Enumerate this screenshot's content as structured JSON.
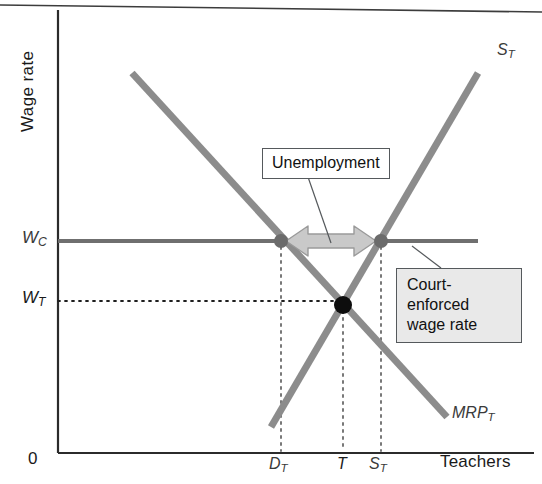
{
  "figure": {
    "type": "economics-labor-market-diagram",
    "background": "#ffffff"
  },
  "axes": {
    "y_label": "Wage rate",
    "x_label": "Teachers",
    "origin_label": "0",
    "axis_color": "#2b2b2b"
  },
  "y_ticks": [
    {
      "id": "wc",
      "base": "W",
      "sub": "C",
      "y": 241
    },
    {
      "id": "wt",
      "base": "W",
      "sub": "T",
      "y": 301
    }
  ],
  "x_ticks": [
    {
      "id": "dt",
      "base": "D",
      "sub": "T",
      "x": 281
    },
    {
      "id": "t",
      "base": "T",
      "sub": "",
      "x": 343
    },
    {
      "id": "st",
      "base": "S",
      "sub": "T",
      "x": 381
    }
  ],
  "curves": [
    {
      "id": "supply",
      "label_base": "S",
      "label_sub": "T",
      "color": "#8c8c8c",
      "x1": 271,
      "y1": 427,
      "x2": 478,
      "y2": 73
    },
    {
      "id": "demand",
      "label_base": "MRP",
      "label_sub": "T",
      "color": "#8c8c8c",
      "x1": 132,
      "y1": 73,
      "x2": 447,
      "y2": 417
    }
  ],
  "wage_line": {
    "id": "court-enforced-wage-line",
    "color": "#6f6f6f",
    "x1": 58,
    "x2": 478,
    "y": 241
  },
  "points": [
    {
      "id": "demand-quantity-point",
      "x": 281,
      "y": 241,
      "r": 7,
      "color": "#6b6b6b"
    },
    {
      "id": "supply-quantity-point",
      "x": 381,
      "y": 241,
      "r": 7,
      "color": "#6b6b6b"
    },
    {
      "id": "equilibrium-point",
      "x": 343,
      "y": 305,
      "r": 9,
      "color": "#0d0d0d"
    }
  ],
  "callouts": {
    "unemployment": {
      "text": "Unemployment",
      "fill": "#ffffff",
      "leader": {
        "x1": 308,
        "y1": 177,
        "x2": 331,
        "y2": 243
      }
    },
    "court_enforced": {
      "line1": "Court-enforced",
      "line2": "wage rate",
      "fill": "#e9e9e9",
      "leader": {
        "x1": 441,
        "y1": 268,
        "x2": 412,
        "y2": 246
      }
    }
  },
  "gap_arrow": {
    "id": "unemployment-gap-arrow",
    "x1": 286,
    "x2": 376,
    "y": 241,
    "fill": "#c9c9c9",
    "stroke": "#9a9a9a"
  },
  "frame": {
    "top_border_color": "#3c3c3c"
  }
}
